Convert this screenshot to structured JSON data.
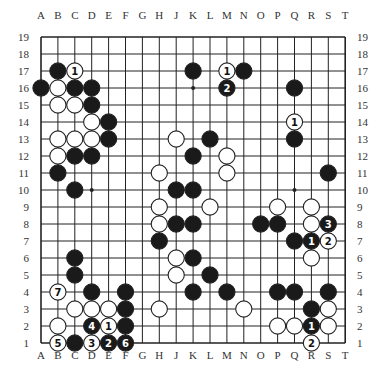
{
  "diagram": {
    "type": "go-board",
    "size": 19,
    "columns": [
      "A",
      "B",
      "C",
      "D",
      "E",
      "F",
      "G",
      "H",
      "J",
      "K",
      "L",
      "M",
      "N",
      "O",
      "P",
      "Q",
      "R",
      "S",
      "T"
    ],
    "rows": [
      "19",
      "18",
      "17",
      "16",
      "15",
      "14",
      "13",
      "12",
      "11",
      "10",
      "9",
      "8",
      "7",
      "6",
      "5",
      "4",
      "3",
      "2",
      "1"
    ],
    "colors": {
      "black": "#1a1a1a",
      "white": "#ffffff",
      "line": "#222222",
      "background": "#ffffff"
    },
    "star_points": [
      "D16",
      "K16",
      "Q16",
      "D10",
      "K10",
      "Q10",
      "D4",
      "K4",
      "Q4"
    ],
    "stones": [
      {
        "pos": "B17",
        "color": "black"
      },
      {
        "pos": "C17",
        "color": "white",
        "label": "1"
      },
      {
        "pos": "K17",
        "color": "black"
      },
      {
        "pos": "M17",
        "color": "white",
        "label": "1"
      },
      {
        "pos": "N17",
        "color": "black"
      },
      {
        "pos": "A16",
        "color": "black"
      },
      {
        "pos": "B16",
        "color": "white"
      },
      {
        "pos": "C16",
        "color": "black"
      },
      {
        "pos": "D16",
        "color": "black"
      },
      {
        "pos": "M16",
        "color": "black",
        "label": "2"
      },
      {
        "pos": "Q16",
        "color": "black"
      },
      {
        "pos": "B15",
        "color": "white"
      },
      {
        "pos": "C15",
        "color": "white"
      },
      {
        "pos": "D15",
        "color": "black"
      },
      {
        "pos": "D14",
        "color": "white"
      },
      {
        "pos": "E14",
        "color": "black"
      },
      {
        "pos": "Q14",
        "color": "white",
        "label": "1"
      },
      {
        "pos": "B13",
        "color": "white"
      },
      {
        "pos": "C13",
        "color": "white"
      },
      {
        "pos": "D13",
        "color": "white"
      },
      {
        "pos": "E13",
        "color": "black"
      },
      {
        "pos": "J13",
        "color": "white"
      },
      {
        "pos": "L13",
        "color": "black"
      },
      {
        "pos": "Q13",
        "color": "black"
      },
      {
        "pos": "B12",
        "color": "white"
      },
      {
        "pos": "C12",
        "color": "black"
      },
      {
        "pos": "D12",
        "color": "black"
      },
      {
        "pos": "K12",
        "color": "black"
      },
      {
        "pos": "M12",
        "color": "white"
      },
      {
        "pos": "B11",
        "color": "black"
      },
      {
        "pos": "H11",
        "color": "white"
      },
      {
        "pos": "M11",
        "color": "white"
      },
      {
        "pos": "S11",
        "color": "black"
      },
      {
        "pos": "C10",
        "color": "black"
      },
      {
        "pos": "J10",
        "color": "black"
      },
      {
        "pos": "K10",
        "color": "black"
      },
      {
        "pos": "H9",
        "color": "white"
      },
      {
        "pos": "L9",
        "color": "white"
      },
      {
        "pos": "P9",
        "color": "white"
      },
      {
        "pos": "R9",
        "color": "white"
      },
      {
        "pos": "H8",
        "color": "white"
      },
      {
        "pos": "J8",
        "color": "black"
      },
      {
        "pos": "K8",
        "color": "black"
      },
      {
        "pos": "O8",
        "color": "black"
      },
      {
        "pos": "P8",
        "color": "black"
      },
      {
        "pos": "R8",
        "color": "white"
      },
      {
        "pos": "S8",
        "color": "black",
        "label": "3"
      },
      {
        "pos": "H7",
        "color": "black"
      },
      {
        "pos": "Q7",
        "color": "black"
      },
      {
        "pos": "R7",
        "color": "black",
        "label": "1"
      },
      {
        "pos": "S7",
        "color": "white",
        "label": "2"
      },
      {
        "pos": "C6",
        "color": "black"
      },
      {
        "pos": "J6",
        "color": "white"
      },
      {
        "pos": "K6",
        "color": "black"
      },
      {
        "pos": "R6",
        "color": "white"
      },
      {
        "pos": "C5",
        "color": "black"
      },
      {
        "pos": "J5",
        "color": "white"
      },
      {
        "pos": "L5",
        "color": "black"
      },
      {
        "pos": "B4",
        "color": "white",
        "label": "7"
      },
      {
        "pos": "D4",
        "color": "black"
      },
      {
        "pos": "F4",
        "color": "black"
      },
      {
        "pos": "K4",
        "color": "black"
      },
      {
        "pos": "M4",
        "color": "black"
      },
      {
        "pos": "P4",
        "color": "black"
      },
      {
        "pos": "Q4",
        "color": "black"
      },
      {
        "pos": "S4",
        "color": "black"
      },
      {
        "pos": "C3",
        "color": "white"
      },
      {
        "pos": "D3",
        "color": "white"
      },
      {
        "pos": "E3",
        "color": "white"
      },
      {
        "pos": "F3",
        "color": "black"
      },
      {
        "pos": "H3",
        "color": "white"
      },
      {
        "pos": "N3",
        "color": "white"
      },
      {
        "pos": "R3",
        "color": "black"
      },
      {
        "pos": "S3",
        "color": "white"
      },
      {
        "pos": "B2",
        "color": "white"
      },
      {
        "pos": "D2",
        "color": "black",
        "label": "4"
      },
      {
        "pos": "E2",
        "color": "white",
        "label": "1"
      },
      {
        "pos": "F2",
        "color": "black"
      },
      {
        "pos": "P2",
        "color": "white"
      },
      {
        "pos": "Q2",
        "color": "white"
      },
      {
        "pos": "R2",
        "color": "black",
        "label": "1"
      },
      {
        "pos": "S2",
        "color": "white"
      },
      {
        "pos": "B1",
        "color": "white",
        "label": "5"
      },
      {
        "pos": "C1",
        "color": "black"
      },
      {
        "pos": "D1",
        "color": "white",
        "label": "3"
      },
      {
        "pos": "E1",
        "color": "black",
        "label": "2"
      },
      {
        "pos": "F1",
        "color": "black",
        "label": "6"
      },
      {
        "pos": "R1",
        "color": "white",
        "label": "2"
      }
    ]
  }
}
